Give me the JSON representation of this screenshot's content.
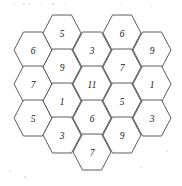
{
  "figure": {
    "type": "hex-grid",
    "orientation": "flat-top",
    "background_color": "#ffffff",
    "cell_fill_color": "#ffffff",
    "cell_stroke_color": "#4a4a4a",
    "label_color": "#1a1a1a",
    "cell_width": 38,
    "cell_height": 36,
    "column_step_x": 29.5,
    "row_step_y": 34,
    "column_offset_y": 17,
    "columns": [
      {
        "name": "column-1",
        "x": 33,
        "y_start": 50,
        "values": [
          6,
          7,
          5
        ]
      },
      {
        "name": "column-2",
        "x": 62,
        "y_start": 33,
        "values": [
          5,
          9,
          1,
          3
        ]
      },
      {
        "name": "column-3",
        "x": 92,
        "y_start": 50,
        "values": [
          3,
          11,
          6,
          7
        ]
      },
      {
        "name": "column-4",
        "x": 122,
        "y_start": 33,
        "values": [
          6,
          7,
          5,
          9
        ]
      },
      {
        "name": "column-5",
        "x": 152,
        "y_start": 50,
        "values": [
          9,
          1,
          3
        ]
      }
    ],
    "cells": [
      {
        "id": "cell-c1-r1",
        "column": 1,
        "row": 1,
        "cx": 33,
        "cy": 50,
        "value": 6
      },
      {
        "id": "cell-c1-r2",
        "column": 1,
        "row": 2,
        "cx": 33,
        "cy": 84,
        "value": 7
      },
      {
        "id": "cell-c1-r3",
        "column": 1,
        "row": 3,
        "cx": 33,
        "cy": 118,
        "value": 5
      },
      {
        "id": "cell-c2-r1",
        "column": 2,
        "row": 1,
        "cx": 62,
        "cy": 33,
        "value": 5
      },
      {
        "id": "cell-c2-r2",
        "column": 2,
        "row": 2,
        "cx": 62,
        "cy": 67,
        "value": 9
      },
      {
        "id": "cell-c2-r3",
        "column": 2,
        "row": 3,
        "cx": 62,
        "cy": 101,
        "value": 1
      },
      {
        "id": "cell-c2-r4",
        "column": 2,
        "row": 4,
        "cx": 62,
        "cy": 135,
        "value": 3
      },
      {
        "id": "cell-c3-r1",
        "column": 3,
        "row": 1,
        "cx": 92,
        "cy": 50,
        "value": 3
      },
      {
        "id": "cell-c3-r2",
        "column": 3,
        "row": 2,
        "cx": 92,
        "cy": 84,
        "value": 11
      },
      {
        "id": "cell-c3-r3",
        "column": 3,
        "row": 3,
        "cx": 92,
        "cy": 118,
        "value": 6
      },
      {
        "id": "cell-c3-r4",
        "column": 3,
        "row": 4,
        "cx": 92,
        "cy": 152,
        "value": 7
      },
      {
        "id": "cell-c4-r1",
        "column": 4,
        "row": 1,
        "cx": 122,
        "cy": 33,
        "value": 6
      },
      {
        "id": "cell-c4-r2",
        "column": 4,
        "row": 2,
        "cx": 122,
        "cy": 67,
        "value": 7
      },
      {
        "id": "cell-c4-r3",
        "column": 4,
        "row": 3,
        "cx": 122,
        "cy": 101,
        "value": 5
      },
      {
        "id": "cell-c4-r4",
        "column": 4,
        "row": 4,
        "cx": 122,
        "cy": 135,
        "value": 9
      },
      {
        "id": "cell-c5-r1",
        "column": 5,
        "row": 1,
        "cx": 152,
        "cy": 50,
        "value": 9
      },
      {
        "id": "cell-c5-r2",
        "column": 5,
        "row": 2,
        "cx": 152,
        "cy": 84,
        "value": 1
      },
      {
        "id": "cell-c5-r3",
        "column": 5,
        "row": 3,
        "cx": 152,
        "cy": 118,
        "value": 3
      }
    ],
    "specks": [
      {
        "x": 13,
        "y": 3,
        "w": 2,
        "h": 2
      },
      {
        "x": 22,
        "y": 3,
        "w": 3,
        "h": 2
      },
      {
        "x": 29,
        "y": 3,
        "w": 2,
        "h": 2
      },
      {
        "x": 40,
        "y": 4,
        "w": 2,
        "h": 1
      },
      {
        "x": 52,
        "y": 3,
        "w": 3,
        "h": 2
      },
      {
        "x": 64,
        "y": 4,
        "w": 2,
        "h": 1
      },
      {
        "x": 120,
        "y": 3,
        "w": 2,
        "h": 1
      },
      {
        "x": 150,
        "y": 5,
        "w": 2,
        "h": 1
      },
      {
        "x": 9,
        "y": 170,
        "w": 2,
        "h": 2
      },
      {
        "x": 24,
        "y": 176,
        "w": 3,
        "h": 2
      },
      {
        "x": 140,
        "y": 166,
        "w": 2,
        "h": 2
      },
      {
        "x": 166,
        "y": 150,
        "w": 2,
        "h": 2
      }
    ]
  }
}
